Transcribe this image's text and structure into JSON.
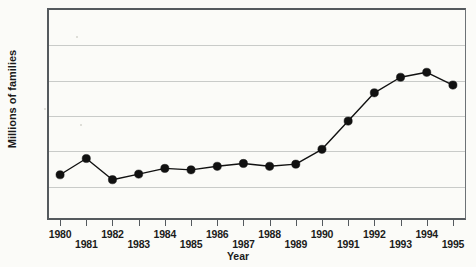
{
  "chart_data": {
    "type": "line",
    "title": "",
    "subtitle": "",
    "xlabel": "Year",
    "ylabel": "Millions of families",
    "categories": [
      "1980",
      "1981",
      "1982",
      "1983",
      "1984",
      "1985",
      "1986",
      "1987",
      "1988",
      "1989",
      "1990",
      "1991",
      "1992",
      "1993",
      "1994",
      "1995"
    ],
    "x": [
      1980,
      1981,
      1982,
      1983,
      1984,
      1985,
      1986,
      1987,
      1988,
      1989,
      1990,
      1991,
      1992,
      1993,
      1994,
      1995
    ],
    "values": [
      3.64,
      3.87,
      3.57,
      3.65,
      3.73,
      3.71,
      3.76,
      3.8,
      3.76,
      3.79,
      4.0,
      4.4,
      4.8,
      5.02,
      5.09,
      4.91
    ],
    "series": [
      {
        "name": "Millions of families",
        "values": [
          3.64,
          3.87,
          3.57,
          3.65,
          3.73,
          3.71,
          3.76,
          3.8,
          3.76,
          3.79,
          4.0,
          4.4,
          4.8,
          5.02,
          5.09,
          4.91
        ]
      }
    ],
    "ylim": [
      3.0,
      6.0
    ],
    "yticks": [
      3.0,
      3.5,
      4.0,
      4.5,
      5.0,
      5.5,
      6.0
    ],
    "ytick_labels": [
      "3.0",
      "3.5",
      "4.0",
      "4.5",
      "5.0",
      "5.5",
      "6.0"
    ],
    "xlim": [
      1979.5,
      1995.5
    ],
    "grid": true,
    "grid_axis": "y",
    "legend": false,
    "legend_position": "none",
    "marker": "filled-circle",
    "line_color": "#111111",
    "marker_color": "#111111",
    "grid_color": "#c9cbc9",
    "axis_color": "#555a5e",
    "background_color": "#fbfbf8"
  },
  "axis": {
    "y_title": "Millions of families",
    "x_title": "Year",
    "y_labels": [
      "6.0",
      "5.5",
      "5.0",
      "4.5",
      "4.0",
      "3.5",
      "3.0"
    ],
    "x_labels": [
      "1980",
      "1981",
      "1982",
      "1983",
      "1984",
      "1985",
      "1986",
      "1987",
      "1988",
      "1989",
      "1990",
      "1991",
      "1992",
      "1993",
      "1994",
      "1995"
    ]
  }
}
